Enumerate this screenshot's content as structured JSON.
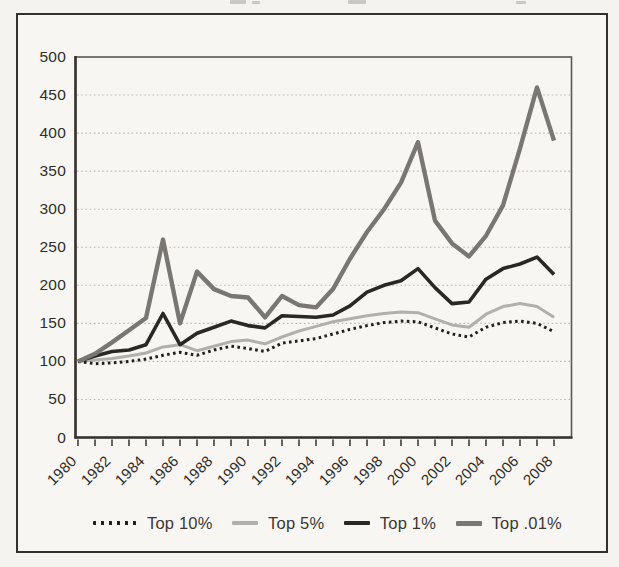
{
  "chart_data": {
    "type": "line",
    "title": "",
    "years": [
      1980,
      1981,
      1982,
      1983,
      1984,
      1985,
      1986,
      1987,
      1988,
      1989,
      1990,
      1991,
      1992,
      1993,
      1994,
      1995,
      1996,
      1997,
      1998,
      1999,
      2000,
      2001,
      2002,
      2003,
      2004,
      2005,
      2006,
      2007,
      2008
    ],
    "x_tick_labels": [
      "1980",
      "1982",
      "1984",
      "1986",
      "1988",
      "1990",
      "1992",
      "1994",
      "1996",
      "1998",
      "2000",
      "2002",
      "2004",
      "2006",
      "2008"
    ],
    "y_ticks": [
      0,
      50,
      100,
      150,
      200,
      250,
      300,
      350,
      400,
      450,
      500
    ],
    "ylim": [
      0,
      500
    ],
    "grid": "horizontal-dotted",
    "legend_position": "bottom",
    "series": [
      {
        "name": "Top 10%",
        "line_style": "dotted",
        "color": "#21201d",
        "values": [
          100,
          97,
          98,
          100,
          103,
          108,
          112,
          108,
          115,
          120,
          117,
          113,
          124,
          127,
          130,
          136,
          142,
          147,
          151,
          153,
          152,
          144,
          136,
          132,
          145,
          151,
          153,
          150,
          139
        ]
      },
      {
        "name": "Top 5%",
        "line_style": "solid",
        "color": "#b2b0aa",
        "values": [
          100,
          102,
          104,
          107,
          111,
          119,
          122,
          114,
          120,
          126,
          128,
          123,
          132,
          140,
          146,
          152,
          156,
          160,
          163,
          165,
          164,
          156,
          148,
          145,
          162,
          172,
          176,
          172,
          158
        ]
      },
      {
        "name": "Top 1%",
        "line_style": "solid",
        "color": "#292824",
        "values": [
          100,
          107,
          113,
          115,
          122,
          163,
          122,
          137,
          145,
          153,
          147,
          144,
          160,
          159,
          158,
          161,
          173,
          191,
          200,
          206,
          222,
          197,
          176,
          178,
          208,
          222,
          228,
          237,
          214
        ]
      },
      {
        "name": "Top .01%",
        "line_style": "solid",
        "color": "#7a7772",
        "values": [
          100,
          110,
          125,
          141,
          157,
          260,
          150,
          218,
          195,
          186,
          184,
          158,
          186,
          174,
          171,
          195,
          235,
          270,
          300,
          335,
          388,
          285,
          255,
          238,
          265,
          305,
          380,
          460,
          390
        ]
      }
    ]
  }
}
